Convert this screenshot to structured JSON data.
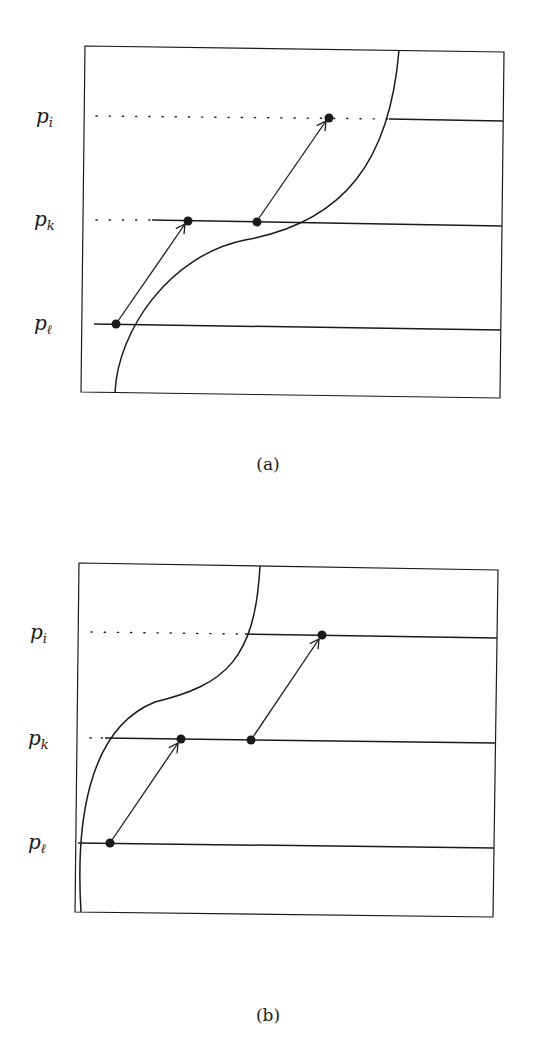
{
  "colors": {
    "ink": "#1a1a1a",
    "background": "#ffffff"
  },
  "panels": [
    {
      "id": "a",
      "caption": "(a)",
      "levels": [
        {
          "base": "p",
          "sub": "i"
        },
        {
          "base": "p",
          "sub": "k"
        },
        {
          "base": "p",
          "sub": "ℓ"
        }
      ],
      "description": "S-shaped boundary curve; level lines p_i, p_k, p_ℓ; two arrows jumping up one level each"
    },
    {
      "id": "b",
      "caption": "(b)",
      "levels": [
        {
          "base": "p",
          "sub": "i"
        },
        {
          "base": "p",
          "sub": "k"
        },
        {
          "base": "p",
          "sub": "ℓ"
        }
      ],
      "description": "Boundary curve shifted left; same arrow construction with all points right of curve"
    }
  ]
}
